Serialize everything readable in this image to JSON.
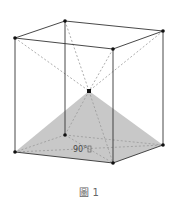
{
  "figure": {
    "caption": "圖 1",
    "angle_label": "90°",
    "colors": {
      "edge": "#333333",
      "dashed": "#999999",
      "fill": "#c8c8c8"
    }
  }
}
